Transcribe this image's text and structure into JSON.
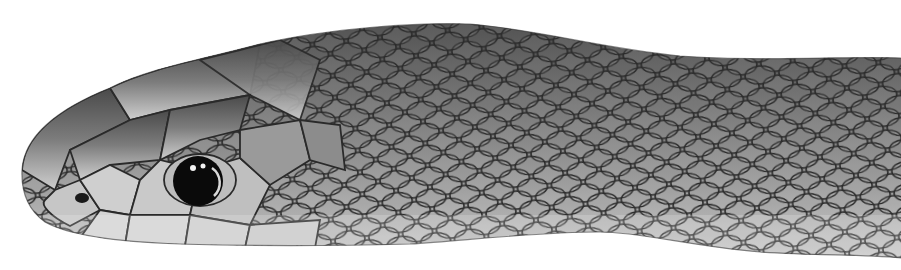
{
  "image": {
    "subject": "Close-up of a snake's head and neck in profile, facing left, grayscale",
    "background": "#ffffff",
    "colors": {
      "body_dark": "#4a4a4a",
      "body_mid": "#7a7a7a",
      "body_light": "#b8b8b8",
      "belly_light": "#d6d6d6",
      "scale_edge": "#2a2a2a",
      "eye": "#0a0a0a"
    }
  }
}
